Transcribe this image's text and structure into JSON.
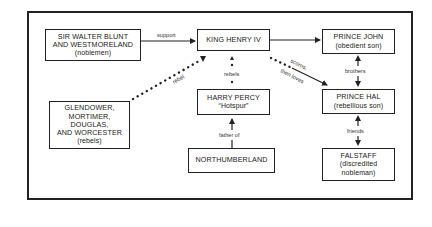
{
  "diagram": {
    "nodes": [
      {
        "id": "blunt",
        "lines": [
          "SIR WALTER BLUNT",
          "AND WESTMORELAND"
        ],
        "sub": "(noblemen)"
      },
      {
        "id": "henry",
        "lines": [
          "KING HENRY IV"
        ],
        "sub": ""
      },
      {
        "id": "john",
        "lines": [
          "PRINCE JOHN"
        ],
        "sub": "(obedient son)"
      },
      {
        "id": "rebels",
        "lines": [
          "GLENDOWER,",
          "MORTIMER,",
          "DOUGLAS,",
          "AND WORCESTER"
        ],
        "sub": "(rebels)"
      },
      {
        "id": "percy",
        "lines": [
          "HARRY PERCY"
        ],
        "sub": "“Hotspur”"
      },
      {
        "id": "hal",
        "lines": [
          "PRINCE HAL"
        ],
        "sub": "(rebellious son)"
      },
      {
        "id": "northumberland",
        "lines": [
          "NORTHUMBERLAND"
        ],
        "sub": ""
      },
      {
        "id": "falstaff",
        "lines": [
          "FALSTAFF"
        ],
        "sub": "(discredited nobleman)"
      }
    ],
    "edges": [
      {
        "from": "blunt",
        "to": "henry",
        "label": "support",
        "style": "solid-arrow"
      },
      {
        "from": "henry",
        "to": "john",
        "label": "",
        "style": "solid-arrow"
      },
      {
        "from": "rebels",
        "to": "henry",
        "label": "rebel",
        "style": "dotted-arrow"
      },
      {
        "from": "percy",
        "to": "henry",
        "label": "rebels",
        "style": "dotted-arrow"
      },
      {
        "from": "henry",
        "to": "hal",
        "label": "scorns, then loves",
        "label_line1": "scorns,",
        "label_line2": "then loves",
        "style": "dotted-then-solid-arrow"
      },
      {
        "from": "john",
        "to": "hal",
        "label": "brothers",
        "style": "double-arrow"
      },
      {
        "from": "northumberland",
        "to": "percy",
        "label": "father of",
        "style": "solid-arrow"
      },
      {
        "from": "hal",
        "to": "falstaff",
        "label": "friends",
        "style": "double-arrow"
      }
    ]
  }
}
